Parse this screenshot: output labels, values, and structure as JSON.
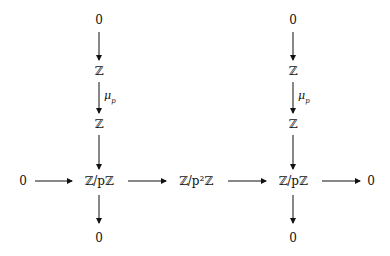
{
  "diagram": {
    "type": "commutative-diagram",
    "nodes": {
      "left_top_zero": "0",
      "left_Z1": "ℤ",
      "left_Z2": "ℤ",
      "left_ZpZ": "ℤ/pℤ",
      "left_bottom_zero": "0",
      "row_left_zero": "0",
      "middle_Zp2Z": "ℤ/p²ℤ",
      "right_top_zero": "0",
      "right_Z1": "ℤ",
      "right_Z2": "ℤ",
      "right_ZpZ": "ℤ/pℤ",
      "right_bottom_zero": "0",
      "row_right_zero": "0"
    },
    "arrow_labels": {
      "left_mu": "μ",
      "left_mu_sub": "p",
      "right_mu": "μ",
      "right_mu_sub": "p"
    },
    "edges": [
      {
        "from": "left_top_zero",
        "to": "left_Z1",
        "label": ""
      },
      {
        "from": "left_Z1",
        "to": "left_Z2",
        "label": "μ_p"
      },
      {
        "from": "left_Z2",
        "to": "left_ZpZ",
        "label": ""
      },
      {
        "from": "left_ZpZ",
        "to": "left_bottom_zero",
        "label": ""
      },
      {
        "from": "right_top_zero",
        "to": "right_Z1",
        "label": ""
      },
      {
        "from": "right_Z1",
        "to": "right_Z2",
        "label": "μ_p"
      },
      {
        "from": "right_Z2",
        "to": "right_ZpZ",
        "label": ""
      },
      {
        "from": "right_ZpZ",
        "to": "right_bottom_zero",
        "label": ""
      },
      {
        "from": "row_left_zero",
        "to": "left_ZpZ",
        "label": ""
      },
      {
        "from": "left_ZpZ",
        "to": "middle_Zp2Z",
        "label": ""
      },
      {
        "from": "middle_Zp2Z",
        "to": "right_ZpZ",
        "label": ""
      },
      {
        "from": "right_ZpZ",
        "to": "row_right_zero",
        "label": ""
      }
    ],
    "colors": {
      "ink": "#111111",
      "background": "#ffffff"
    }
  }
}
